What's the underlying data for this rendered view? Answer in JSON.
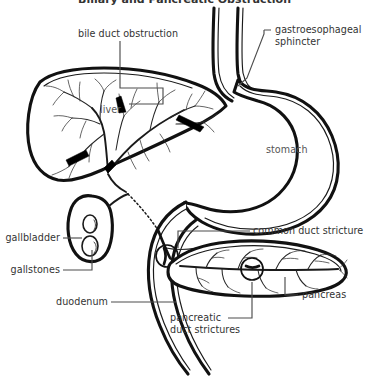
{
  "figure": {
    "title": "Biliary and Pancreatic Obstruction",
    "title_clipped": true,
    "type": "medical-line-art-diagram",
    "background_color": "#ffffff",
    "ink_color": "#111111",
    "label_color": "#333333",
    "leader_color": "#4d4d4d"
  },
  "labels": {
    "bile_duct_obstruction": "bile duct obstruction",
    "gastroesophageal_sphincter_line1": "gastroesophageal",
    "gastroesophageal_sphincter_line2": "sphincter",
    "liver": "liver",
    "stomach": "stomach",
    "gallbladder": "gallbladder",
    "gallstones": "gallstones",
    "duodenum": "duodenum",
    "common_duct_stricture": "common duct stricture",
    "pancreas": "pancreas",
    "pancreatic_duct_strictures_line1": "pancreatic",
    "pancreatic_duct_strictures_line2": "duct strictures"
  },
  "structures": [
    {
      "name": "liver",
      "kind": "organ",
      "note": "wedge-shaped organ, upper left, containing branching intrahepatic bile ducts"
    },
    {
      "name": "stomach",
      "kind": "organ",
      "note": "large J-shaped sac, upper right"
    },
    {
      "name": "esophagus",
      "kind": "organ",
      "note": "vertical double-walled tube entering stomach from above"
    },
    {
      "name": "gastroesophageal-sphincter",
      "kind": "landmark",
      "note": "narrowing at esophagus-stomach junction"
    },
    {
      "name": "gallbladder",
      "kind": "organ",
      "note": "small oval sac below liver holding gallstones"
    },
    {
      "name": "gallstones",
      "kind": "finding",
      "count": 2,
      "note": "two small ovals inside gallbladder"
    },
    {
      "name": "duodenum",
      "kind": "organ",
      "note": "C-shaped double-walled tube curving down from stomach"
    },
    {
      "name": "pancreas",
      "kind": "organ",
      "note": "elongated tapering organ with branching pancreatic duct tree"
    },
    {
      "name": "common-bile-duct",
      "kind": "duct",
      "note": "runs from liver hilum behind duodenum to ampulla"
    },
    {
      "name": "pancreatic-duct",
      "kind": "duct",
      "note": "main duct running length of pancreas with side branches"
    }
  ],
  "findings": {
    "bile_duct_obstructions": {
      "label": "bile duct obstruction",
      "count": 4,
      "marker": "solid black wedge",
      "location": "intrahepatic bile duct branch points"
    },
    "common_duct_stricture": {
      "label": "common duct stricture",
      "count": 1,
      "marker": "open circle around narrowed duct",
      "location": "common bile duct near ampulla"
    },
    "pancreatic_duct_strictures": {
      "label": "pancreatic duct strictures",
      "count": 1,
      "marker": "open circle around narrowed duct",
      "location": "main pancreatic duct, mid-body"
    },
    "gallstones": {
      "label": "gallstones",
      "count": 2,
      "marker": "small outlined ovals",
      "location": "gallbladder lumen"
    }
  }
}
